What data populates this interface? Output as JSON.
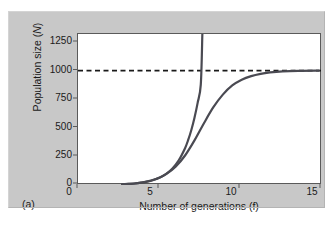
{
  "figure": {
    "panel_letter": "(a)",
    "background_color": "#c8c8c8",
    "plot_background": "#ffffff",
    "frame_color": "#5a5a5a"
  },
  "annotations": {
    "carrying_capacity_line1": "Carrying",
    "carrying_capacity_line2": "capacity (K)"
  },
  "chart_data": {
    "type": "line",
    "title": "",
    "xlabel": "Number of generations (f)",
    "ylabel": "Population size (N)",
    "xlim": [
      0,
      15.5
    ],
    "ylim": [
      0,
      1320
    ],
    "xticks": [
      "0",
      "5",
      "10",
      "15"
    ],
    "xtick_values": [
      0,
      5,
      10,
      15
    ],
    "yticks": [
      "0",
      "250",
      "500",
      "750",
      "1000",
      "1250"
    ],
    "ytick_values": [
      0,
      250,
      500,
      750,
      1000,
      1250
    ],
    "grid": false,
    "legend": "none",
    "line_color": "#4a4a52",
    "line_width": 2.2,
    "reference_lines": [
      {
        "name": "carrying-capacity",
        "orientation": "horizontal",
        "y": 1000,
        "style": "dashed",
        "color": "#1a1a1a",
        "label": "Carrying capacity (K)"
      }
    ],
    "series": [
      {
        "name": "exponential-growth",
        "x": [
          2.8,
          3.2,
          3.6,
          4.0,
          4.4,
          4.8,
          5.2,
          5.6,
          6.0,
          6.4,
          6.8,
          7.0,
          7.2,
          7.4,
          7.6,
          7.8,
          7.9
        ],
        "values": [
          6,
          9,
          13,
          20,
          29,
          44,
          65,
          97,
          145,
          216,
          322,
          394,
          481,
          588,
          718,
          877,
          1320
        ]
      },
      {
        "name": "logistic-growth",
        "x": [
          2.8,
          3.5,
          4.2,
          5.0,
          5.6,
          6.2,
          6.8,
          7.4,
          8.0,
          8.6,
          9.2,
          9.8,
          10.4,
          11.0,
          11.6,
          12.2,
          13.0,
          14.0,
          15.3
        ],
        "values": [
          6,
          12,
          25,
          55,
          95,
          160,
          258,
          390,
          540,
          680,
          790,
          870,
          920,
          952,
          972,
          984,
          993,
          998,
          1000
        ]
      }
    ]
  }
}
